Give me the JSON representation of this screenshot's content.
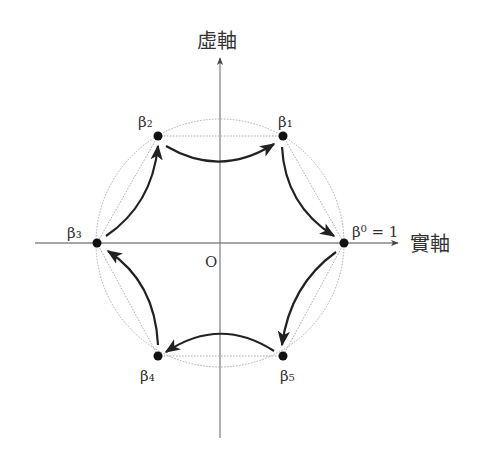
{
  "diagram": {
    "axes": {
      "imaginary_label": "虛軸",
      "real_label": "實軸",
      "origin_label": "O"
    },
    "points": [
      {
        "id": "beta0",
        "label": "β⁰ = 1",
        "x": 344,
        "y": 243
      },
      {
        "id": "beta1",
        "label": "β₁",
        "x": 283,
        "y": 136
      },
      {
        "id": "beta2",
        "label": "β₂",
        "x": 158,
        "y": 136
      },
      {
        "id": "beta3",
        "label": "β₃",
        "x": 97,
        "y": 243
      },
      {
        "id": "beta4",
        "label": "β₄",
        "x": 158,
        "y": 356
      },
      {
        "id": "beta5",
        "label": "β₅",
        "x": 283,
        "y": 356
      }
    ],
    "arrows": [
      {
        "from": "beta0",
        "to": "beta5"
      },
      {
        "from": "beta5",
        "to": "beta4"
      },
      {
        "from": "beta4",
        "to": "beta3"
      },
      {
        "from": "beta3",
        "to": "beta2"
      },
      {
        "from": "beta2",
        "to": "beta1"
      },
      {
        "from": "beta1",
        "to": "beta0"
      }
    ],
    "colors": {
      "axis": "#888888",
      "circle": "#aaaaaa",
      "arrow": "#222222",
      "point": "#111111"
    }
  }
}
